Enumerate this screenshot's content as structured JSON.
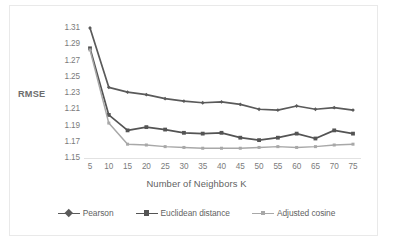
{
  "chart_data": {
    "type": "line",
    "title": "",
    "xlabel": "Number of Neighbors K",
    "ylabel": "RMSE",
    "x": [
      5,
      10,
      15,
      20,
      25,
      30,
      35,
      40,
      45,
      50,
      55,
      60,
      65,
      70,
      75
    ],
    "xtick_labels": [
      "5",
      "10",
      "15",
      "20",
      "25",
      "30",
      "35",
      "40",
      "45",
      "50",
      "55",
      "60",
      "65",
      "70",
      "75"
    ],
    "ytick_labels": [
      "1.31",
      "1.29",
      "1.27",
      "1.25",
      "1.23",
      "1.21",
      "1.19",
      "1.17",
      "1.15"
    ],
    "yticks": [
      1.31,
      1.29,
      1.27,
      1.25,
      1.23,
      1.21,
      1.19,
      1.17,
      1.15
    ],
    "ylim": [
      1.15,
      1.31
    ],
    "xlim": [
      5,
      75
    ],
    "grid": false,
    "legend_position": "bottom",
    "series": [
      {
        "name": "Pearson",
        "color": "#5a5a5a",
        "marker": "diamond",
        "values": [
          1.31,
          1.237,
          1.231,
          1.228,
          1.223,
          1.22,
          1.218,
          1.219,
          1.216,
          1.21,
          1.209,
          1.214,
          1.21,
          1.212,
          1.209
        ]
      },
      {
        "name": "Euclidean distance",
        "color": "#545454",
        "marker": "square",
        "values": [
          1.285,
          1.203,
          1.184,
          1.188,
          1.185,
          1.181,
          1.18,
          1.181,
          1.175,
          1.172,
          1.175,
          1.18,
          1.174,
          1.184,
          1.18
        ]
      },
      {
        "name": "Adjusted cosine",
        "color": "#a8a8a8",
        "marker": "square",
        "values": [
          1.283,
          1.193,
          1.167,
          1.166,
          1.164,
          1.163,
          1.162,
          1.162,
          1.162,
          1.163,
          1.164,
          1.163,
          1.164,
          1.166,
          1.167
        ]
      }
    ]
  },
  "legend": {
    "items": [
      {
        "label": "Pearson"
      },
      {
        "label": "Euclidean distance"
      },
      {
        "label": "Adjusted cosine"
      }
    ]
  },
  "colors": {
    "series_dark": "#5a5a5a",
    "series_mid": "#545454",
    "series_light": "#a8a8a8",
    "axis_text": "#7b7b7b",
    "title_text": "#5f5f5f",
    "baseline": "#e2e2e2",
    "frame": "#e9e9e9",
    "background": "#ffffff"
  }
}
